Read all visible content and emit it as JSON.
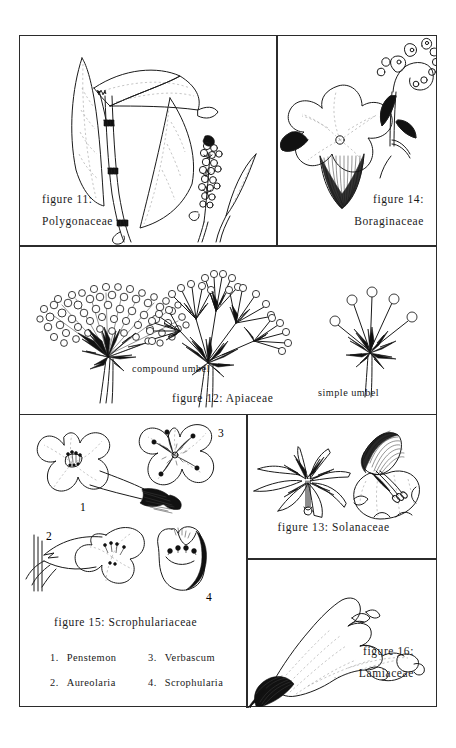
{
  "plate": {
    "title": "Botanical family flower illustrations plate",
    "panels": [
      {
        "id": "fig11",
        "caption_line1": "figure  11:",
        "caption_line2": "Polygonaceae",
        "family": "Polygonaceae",
        "figure_number": "11",
        "caption_align": "left"
      },
      {
        "id": "fig14",
        "caption_line1": "figure  14:",
        "caption_line2": "Boraginaceae",
        "family": "Boraginaceae",
        "figure_number": "14",
        "caption_align": "right"
      },
      {
        "id": "fig12",
        "caption_main": "figure 12:  Apiaceae",
        "family": "Apiaceae",
        "figure_number": "12",
        "label_left": "compound  umbel",
        "label_right": "simple  umbel"
      },
      {
        "id": "fig15",
        "caption_main": "figure  15:  Scrophulariaceae",
        "family": "Scrophulariaceae",
        "figure_number": "15",
        "diagram_numbers": [
          "1",
          "2",
          "3",
          "4"
        ],
        "legend": [
          {
            "num": "1.",
            "name": "Penstemon"
          },
          {
            "num": "2.",
            "name": "Aureolaria"
          },
          {
            "num": "3.",
            "name": "Verbascum"
          },
          {
            "num": "4.",
            "name": "Scrophularia"
          }
        ]
      },
      {
        "id": "fig13",
        "caption_main": "figure  13:  Solanaceae",
        "family": "Solanaceae",
        "figure_number": "13"
      },
      {
        "id": "fig16",
        "caption_line1": "figure  16:",
        "caption_line2": "Lamiaceae",
        "family": "Lamiaceae",
        "figure_number": "16",
        "caption_align": "right"
      }
    ],
    "colors": {
      "ink": "#1a1a1a",
      "border": "#2b2b2b",
      "background": "#ffffff",
      "vein": "#8d8d8d"
    }
  }
}
